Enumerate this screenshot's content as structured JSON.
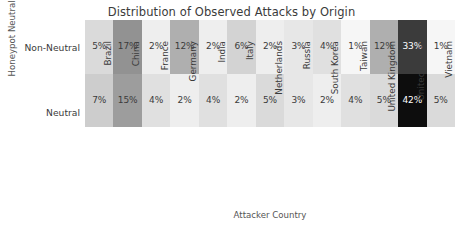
{
  "chart_data": {
    "type": "heatmap",
    "title": "Distribution of Observed Attacks by Origin",
    "xlabel": "Attacker Country",
    "ylabel": "Honeypot Neutrality",
    "categories": [
      "Brazil",
      "China",
      "France",
      "Germany",
      "India",
      "Italy",
      "Netherlands",
      "Russia",
      "South Korea",
      "Taiwan",
      "United Kingdom",
      "United States",
      "Vietnam"
    ],
    "rows": [
      "Non-Neutral",
      "Neutral"
    ],
    "grid": false,
    "legend": "none",
    "colormap": "greys",
    "value_unit": "%",
    "vmin": 0,
    "vmax": 42,
    "series": [
      {
        "name": "Non-Neutral",
        "values": [
          5,
          17,
          2,
          12,
          2,
          6,
          2,
          3,
          4,
          1,
          12,
          33,
          1
        ],
        "labels": [
          "5%",
          "17%",
          "2%",
          "12%",
          "2%",
          "6%",
          "2%",
          "3%",
          "4%",
          "1%",
          "12%",
          "33%",
          "1%"
        ]
      },
      {
        "name": "Neutral",
        "values": [
          7,
          15,
          4,
          2,
          4,
          2,
          5,
          3,
          2,
          4,
          5,
          42,
          5
        ],
        "labels": [
          "7%",
          "15%",
          "4%",
          "2%",
          "4%",
          "2%",
          "5%",
          "3%",
          "2%",
          "4%",
          "5%",
          "42%",
          "5%"
        ]
      }
    ]
  },
  "colors": {
    "text_dark": "#3b3b3b",
    "text_light": "#ffffff",
    "cell_min": "#ffffff",
    "cell_max": "#0d0d0d"
  }
}
